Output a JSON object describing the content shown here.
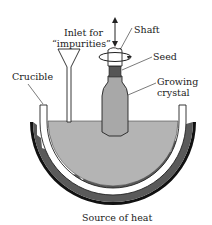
{
  "diagram": {
    "type": "czochralski-crystal-growth",
    "labels": {
      "inlet_line1": "Inlet for",
      "inlet_line2": "“impurities”",
      "shaft": "Shaft",
      "seed": "Seed",
      "growing_line1": "Growing",
      "growing_line2": "crystal",
      "crucible": "Crucible",
      "heat_source": "Source of heat"
    },
    "colors": {
      "melt": "#b4b4b4",
      "crystal": "#a8a8a8",
      "seed": "#555555",
      "heat": "#555555",
      "outline": "#222222"
    }
  }
}
